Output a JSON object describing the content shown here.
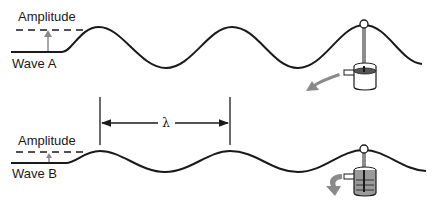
{
  "diagram": {
    "wave_a": {
      "label": "Wave A",
      "amplitude_label": "Amplitude",
      "size": "large amplitude"
    },
    "wave_b": {
      "label": "Wave B",
      "amplitude_label": "Amplitude",
      "wavelength_symbol": "λ",
      "size": "small amplitude"
    },
    "colors": {
      "line": "#1a1a1a",
      "arrow_gray": "#8a8a8a"
    }
  }
}
